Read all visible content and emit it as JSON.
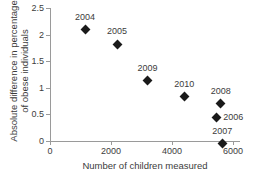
{
  "chart_data": {
    "type": "scatter",
    "title": "",
    "xlabel": "Number of children measured",
    "ylabel_line1": "Absolute difference in percentage",
    "ylabel_line2": "of obese individuals",
    "xlim": [
      0,
      6200
    ],
    "ylim": [
      -0.1,
      2.5
    ],
    "x_ticks": [
      "0",
      "2000",
      "4000",
      "6000"
    ],
    "x_tick_values": [
      0,
      2000,
      4000,
      6000
    ],
    "y_ticks": [
      "0",
      "0.5",
      "1",
      "1.5",
      "2",
      "2.5"
    ],
    "y_tick_values": [
      0,
      0.5,
      1,
      1.5,
      2,
      2.5
    ],
    "grid": false,
    "legend": "none",
    "marker_shape": "diamond",
    "marker_color": "#1a1a1a",
    "axis_color": "#9a9a9a",
    "text_color": "#3c3c3c",
    "points": [
      {
        "label": "2004",
        "x": 1150,
        "y": 2.09,
        "label_position": "above"
      },
      {
        "label": "2005",
        "x": 2200,
        "y": 1.82,
        "label_position": "above"
      },
      {
        "label": "2009",
        "x": 3200,
        "y": 1.13,
        "label_position": "above"
      },
      {
        "label": "2010",
        "x": 4400,
        "y": 0.83,
        "label_position": "above"
      },
      {
        "label": "2008",
        "x": 5600,
        "y": 0.7,
        "label_position": "above"
      },
      {
        "label": "2006",
        "x": 5450,
        "y": 0.45,
        "label_position": "right"
      },
      {
        "label": "2007",
        "x": 5650,
        "y": -0.05,
        "label_position": "above"
      }
    ]
  }
}
